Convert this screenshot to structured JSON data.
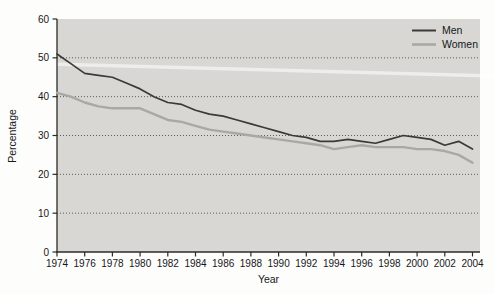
{
  "figure": {
    "title": ""
  },
  "chart_data": {
    "type": "line",
    "title": "",
    "xlabel": "Year",
    "ylabel": "Percentage",
    "x": [
      1974,
      1975,
      1976,
      1977,
      1978,
      1979,
      1980,
      1981,
      1982,
      1983,
      1984,
      1985,
      1986,
      1987,
      1988,
      1989,
      1990,
      1991,
      1992,
      1993,
      1994,
      1995,
      1996,
      1997,
      1998,
      1999,
      2000,
      2001,
      2002,
      2003,
      2004
    ],
    "series": [
      {
        "name": "Men",
        "color": "#3a3a36",
        "stroke_width": 1.7,
        "values": [
          51,
          48.5,
          46,
          45.5,
          45,
          43.5,
          42,
          40,
          38.5,
          38,
          36.5,
          35.5,
          35,
          34,
          33,
          32,
          31,
          30,
          29.5,
          28.5,
          28.5,
          29,
          28.5,
          28,
          29,
          30,
          29.5,
          29,
          27.5,
          28.5,
          26.5
        ]
      },
      {
        "name": "Women",
        "color": "#a9a9a4",
        "stroke_width": 2.4,
        "values": [
          41,
          40,
          38.5,
          37.5,
          37,
          37,
          37,
          35.5,
          34,
          33.5,
          32.5,
          31.5,
          31,
          30.5,
          30,
          29.5,
          29,
          28.5,
          28,
          27.5,
          26.5,
          27,
          27.5,
          27,
          27,
          27,
          26.5,
          26.5,
          26,
          25,
          23
        ]
      }
    ],
    "ylim": [
      0,
      60
    ],
    "yticks": [
      0,
      10,
      20,
      30,
      40,
      50,
      60
    ],
    "xticks": [
      1974,
      1976,
      1978,
      1980,
      1982,
      1984,
      1986,
      1988,
      1990,
      1992,
      1994,
      1996,
      1998,
      2000,
      2002,
      2004
    ],
    "grid": "horizontal dotted lines at 10-50",
    "legend_position": "top-right inside plot",
    "colors": {
      "plot_background": "#d8d7d3",
      "page_background": "#fdfdfc",
      "axis": "#2b2b27",
      "gridline": "#4f4f49",
      "text": "#17171a",
      "scan_streak": "#ffffff"
    }
  }
}
